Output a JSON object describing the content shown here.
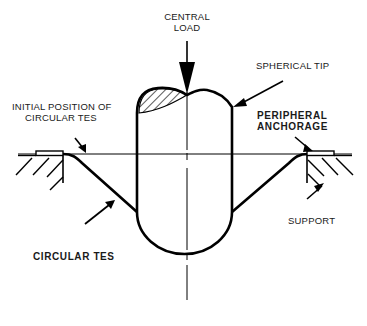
{
  "diagram": {
    "title": "",
    "labels": {
      "central_load": [
        "CENTRAL",
        "LOAD"
      ],
      "spherical_tip": "SPHERICAL TIP",
      "initial_position": [
        "INITIAL POSITION OF",
        "CIRCULAR TES"
      ],
      "peripheral_anchorage": [
        "PERIPHERAL",
        "ANCHORAGE"
      ],
      "support": "SUPPORT",
      "circular_tes": "CIRCULAR TES"
    },
    "colors": {
      "line": "#000000",
      "background": "#ffffff"
    },
    "components": [
      "central-load-arrow",
      "spherical-tip-indenter",
      "circular-tes-membrane",
      "peripheral-anchorage",
      "support",
      "initial-position-line",
      "center-axis"
    ]
  }
}
